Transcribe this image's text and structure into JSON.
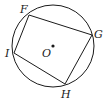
{
  "diagram": {
    "type": "inscribed-quadrilateral",
    "circle": {
      "cx": 53,
      "cy": 46,
      "r": 41,
      "stroke": "#1a1a1a"
    },
    "center": {
      "label": "O",
      "x": 53,
      "y": 46
    },
    "vertices": [
      {
        "label": "F",
        "x": 29,
        "y": 15
      },
      {
        "label": "G",
        "x": 92,
        "y": 35
      },
      {
        "label": "H",
        "x": 65,
        "y": 84
      },
      {
        "label": "I",
        "x": 14,
        "y": 53
      }
    ],
    "labels": {
      "F": "F",
      "G": "G",
      "H": "H",
      "I": "I",
      "O": "O"
    }
  }
}
